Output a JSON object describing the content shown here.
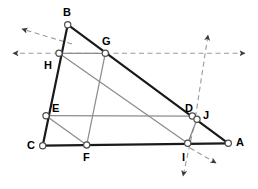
{
  "figure": {
    "width": 258,
    "height": 189,
    "background": "#ffffff",
    "colors": {
      "outline": "#1a1a1a",
      "inner_line": "#8c8c8c",
      "dashed_line": "#9a9a9a",
      "node_fill": "#ffffff",
      "node_stroke": "#4d4d4d",
      "label_text": "#000000"
    },
    "points": [
      {
        "name": "A",
        "x": 228.3,
        "y": 143.3,
        "label_x": 236,
        "label_y": 137
      },
      {
        "name": "B",
        "x": 67.7,
        "y": 24.7,
        "label_x": 63,
        "label_y": 7
      },
      {
        "name": "C",
        "x": 42.7,
        "y": 145.7,
        "label_x": 27,
        "label_y": 140
      },
      {
        "name": "D",
        "x": 192.3,
        "y": 116.0,
        "label_x": 185,
        "label_y": 103
      },
      {
        "name": "E",
        "x": 46.0,
        "y": 115.7,
        "label_x": 52,
        "label_y": 103
      },
      {
        "name": "F",
        "x": 86.7,
        "y": 145.0,
        "label_x": 83,
        "label_y": 152
      },
      {
        "name": "G",
        "x": 105.3,
        "y": 53.3,
        "label_x": 102,
        "label_y": 36
      },
      {
        "name": "H",
        "x": 59.0,
        "y": 53.3,
        "label_x": 44,
        "label_y": 60
      },
      {
        "name": "I",
        "x": 187.7,
        "y": 143.3,
        "label_x": 182,
        "label_y": 152
      },
      {
        "name": "J",
        "x": 197.0,
        "y": 119.3,
        "label_x": 203,
        "label_y": 110
      }
    ],
    "solid_outline_segments": [
      {
        "name": "segment-B-C",
        "from": "B",
        "to": "C"
      },
      {
        "name": "segment-B-A",
        "from": "B",
        "to": "A"
      },
      {
        "name": "segment-C-A",
        "from": "C",
        "to": "A"
      }
    ],
    "inner_segments": [
      {
        "name": "segment-H-G",
        "from": "H",
        "to": "G"
      },
      {
        "name": "segment-H-I",
        "from": "H",
        "to": "I"
      },
      {
        "name": "segment-G-F",
        "from": "G",
        "to": "F"
      },
      {
        "name": "segment-E-D",
        "from": "E",
        "to": "D"
      },
      {
        "name": "segment-E-F",
        "from": "E",
        "to": "F"
      },
      {
        "name": "segment-I-J",
        "from": "I",
        "to": "J"
      }
    ],
    "dashed_rays": [
      {
        "name": "ray-horizontal-left",
        "x1": 59,
        "y1": 53.3,
        "x2": 13,
        "y2": 53.3,
        "arrow": true
      },
      {
        "name": "ray-horizontal-right",
        "x1": 105,
        "y1": 53.3,
        "x2": 245,
        "y2": 53.3,
        "arrow": true
      },
      {
        "name": "ray-diagonal-upleft",
        "x1": 72,
        "y1": 44,
        "x2": 22,
        "y2": 29,
        "arrow": true
      },
      {
        "name": "ray-diagonal-downright",
        "x1": 190,
        "y1": 148,
        "x2": 216,
        "y2": 163,
        "arrow": true
      },
      {
        "name": "ray-steep-up",
        "x1": 196,
        "y1": 117,
        "x2": 208,
        "y2": 35,
        "arrow": true
      },
      {
        "name": "ray-steep-down",
        "x1": 193,
        "y1": 130,
        "x2": 183,
        "y2": 176,
        "arrow": true
      }
    ]
  }
}
